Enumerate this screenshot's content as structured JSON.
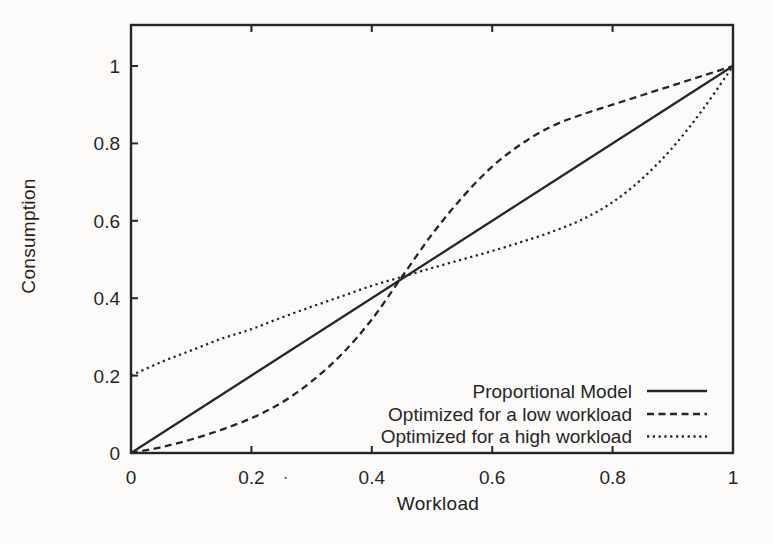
{
  "chart_data": {
    "type": "line",
    "title": "",
    "xlabel": "Workload",
    "ylabel": "Consumption",
    "xlim": [
      0,
      1
    ],
    "ylim": [
      0,
      1.1
    ],
    "x_ticks": [
      "0",
      "0.2",
      "0.4",
      "0.6",
      "0.8",
      "1"
    ],
    "x_tick_values": [
      0,
      0.2,
      0.4,
      0.6,
      0.8,
      1
    ],
    "y_ticks": [
      "0",
      "0.2",
      "0.4",
      "0.6",
      "0.8",
      "1"
    ],
    "y_tick_values": [
      0,
      0.2,
      0.4,
      0.6,
      0.8,
      1
    ],
    "grid": false,
    "legend_position": "bottom-right-inside",
    "axis_color": "#262626",
    "background_color": "#fcfbf9",
    "series": [
      {
        "name": "Proportional Model",
        "style": "solid",
        "points": [
          [
            0,
            0
          ],
          [
            1,
            1
          ]
        ]
      },
      {
        "name": "Optimized for a low workload",
        "style": "dashed",
        "points": [
          [
            0,
            0
          ],
          [
            0.05,
            0.015
          ],
          [
            0.1,
            0.035
          ],
          [
            0.15,
            0.06
          ],
          [
            0.2,
            0.09
          ],
          [
            0.25,
            0.13
          ],
          [
            0.3,
            0.185
          ],
          [
            0.35,
            0.255
          ],
          [
            0.4,
            0.345
          ],
          [
            0.45,
            0.455
          ],
          [
            0.5,
            0.565
          ],
          [
            0.55,
            0.66
          ],
          [
            0.6,
            0.74
          ],
          [
            0.65,
            0.8
          ],
          [
            0.7,
            0.845
          ],
          [
            0.75,
            0.875
          ],
          [
            0.8,
            0.9
          ],
          [
            0.85,
            0.925
          ],
          [
            0.9,
            0.95
          ],
          [
            0.95,
            0.975
          ],
          [
            1,
            1
          ]
        ]
      },
      {
        "name": "Optimized for a high workload",
        "style": "dotted",
        "points": [
          [
            0,
            0.2
          ],
          [
            0.05,
            0.235
          ],
          [
            0.1,
            0.265
          ],
          [
            0.15,
            0.295
          ],
          [
            0.2,
            0.32
          ],
          [
            0.25,
            0.35
          ],
          [
            0.3,
            0.378
          ],
          [
            0.35,
            0.405
          ],
          [
            0.4,
            0.432
          ],
          [
            0.45,
            0.455
          ],
          [
            0.5,
            0.478
          ],
          [
            0.55,
            0.5
          ],
          [
            0.6,
            0.522
          ],
          [
            0.65,
            0.546
          ],
          [
            0.7,
            0.572
          ],
          [
            0.75,
            0.604
          ],
          [
            0.8,
            0.648
          ],
          [
            0.85,
            0.71
          ],
          [
            0.9,
            0.79
          ],
          [
            0.95,
            0.888
          ],
          [
            1,
            1
          ]
        ]
      }
    ]
  },
  "scan_artifact": {
    "glyph": "."
  }
}
